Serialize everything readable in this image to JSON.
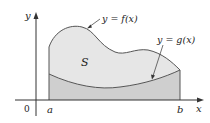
{
  "figure": {
    "region_label": "S",
    "curves": [
      {
        "name": "f",
        "label": "y = f(x)",
        "role": "upper boundary"
      },
      {
        "name": "g",
        "label": "y = g(x)",
        "role": "lower boundary"
      }
    ],
    "axes": {
      "x_label": "x",
      "y_label": "y",
      "origin_label": "0",
      "x_ticks": [
        "a",
        "b"
      ]
    },
    "colors": {
      "region_S_fill": "#e6e6e6",
      "under_g_fill": "#cfcfcf",
      "curve_stroke": "#555555",
      "axis_stroke": "#333333"
    }
  }
}
